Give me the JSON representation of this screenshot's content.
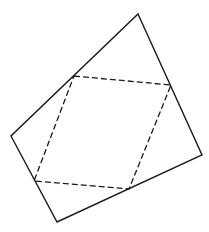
{
  "diagram": {
    "background": "#ffffff",
    "stroke_color": "#1a1a1a",
    "outer_quadrilateral": {
      "style": "solid",
      "points": [
        [
          138,
          14
        ],
        [
          202,
          155
        ],
        [
          57,
          222
        ],
        [
          11,
          136
        ]
      ]
    },
    "inner_quadrilateral": {
      "style": "dashed",
      "points": [
        [
          74,
          76
        ],
        [
          171,
          85
        ],
        [
          129,
          189
        ],
        [
          34,
          181
        ]
      ]
    }
  }
}
